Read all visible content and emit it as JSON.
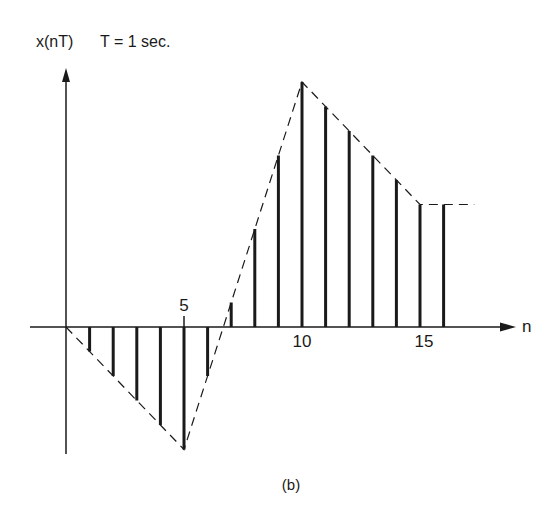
{
  "figure": {
    "ylabel": "x(nT)",
    "period_note": "T = 1 sec.",
    "xlabel": "n",
    "caption": "(b)",
    "tick_labels": [
      {
        "n": 5,
        "label": "5",
        "position": "above"
      },
      {
        "n": 10,
        "label": "10",
        "position": "below"
      },
      {
        "n": 15,
        "label": "15",
        "position": "below"
      }
    ]
  },
  "chart_data": {
    "type": "stem",
    "title": "x(nT)  T = 1 sec.",
    "xlabel": "n",
    "ylabel": "x(nT)",
    "caption": "(b)",
    "x": [
      0,
      1,
      2,
      3,
      4,
      5,
      6,
      7,
      8,
      9,
      10,
      11,
      12,
      13,
      14,
      15,
      16
    ],
    "values": [
      0,
      -1,
      -2,
      -3,
      -4,
      -5,
      -2,
      1,
      4,
      7,
      10,
      9,
      8,
      7,
      6,
      5,
      5
    ],
    "envelope": {
      "style": "dashed",
      "points": [
        [
          0,
          0
        ],
        [
          5,
          -5
        ],
        [
          10,
          10
        ],
        [
          15,
          5
        ],
        [
          17.3,
          5
        ]
      ]
    },
    "x_ticks_labeled": [
      5,
      10,
      15
    ],
    "xlim": [
      0,
      18
    ],
    "ylim": [
      -5.2,
      10.5
    ],
    "grid": false,
    "legend": null,
    "colors": {
      "ink": "#1a1a1a",
      "background": "#ffffff"
    }
  }
}
